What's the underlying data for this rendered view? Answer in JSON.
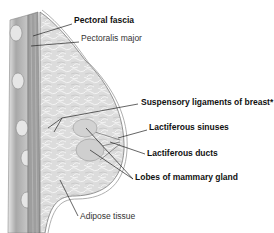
{
  "diagram": {
    "labels": [
      {
        "id": "pectoral-fascia",
        "text": "Pectoral fascia",
        "bold": true,
        "x": 74,
        "y": 20
      },
      {
        "id": "pectoralis-major",
        "text": "Pectoralis major",
        "bold": false,
        "x": 81,
        "y": 38
      },
      {
        "id": "suspensory-ligaments",
        "text": "Suspensory ligaments of breast*",
        "bold": true,
        "x": 141,
        "y": 101
      },
      {
        "id": "lactiferous-sinuses",
        "text": "Lactiferous sinuses",
        "bold": true,
        "x": 149,
        "y": 126
      },
      {
        "id": "lactiferous-ducts",
        "text": "Lactiferous ducts",
        "bold": true,
        "x": 147,
        "y": 152
      },
      {
        "id": "lobes-mammary-gland",
        "text": "Lobes of mammary gland",
        "bold": true,
        "x": 135,
        "y": 176
      },
      {
        "id": "adipose-tissue",
        "text": "Adipose tissue",
        "bold": false,
        "x": 80,
        "y": 215
      }
    ],
    "colors": {
      "tissue_fill": "#d9d9d9",
      "tissue_dark": "#9a9a9a",
      "muscle_fill": "#bdbdbd",
      "outline": "#7a7a7a",
      "leader_line": "#222222"
    }
  }
}
